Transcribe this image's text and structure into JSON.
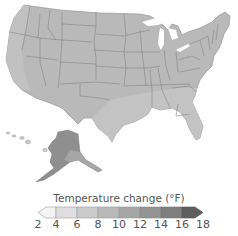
{
  "map": {
    "subject": "United States projected temperature change",
    "regions": [
      "contiguous-us",
      "alaska",
      "hawaii"
    ],
    "colors": {
      "water": "#ffffff",
      "border": "#7a7a7a",
      "west": "#b9b9b9",
      "plains": "#b0b0b0",
      "southeast": "#c4c4c4",
      "northeast": "#adadad",
      "alaska_north": "#8f8f8f",
      "alaska_south": "#a6a6a6",
      "hawaii": "#c8c8c8"
    }
  },
  "legend": {
    "title": "Temperature change (°F)",
    "ticks": [
      "2",
      "4",
      "6",
      "8",
      "10",
      "12",
      "14",
      "16",
      "18"
    ],
    "bins": [
      {
        "from": 2,
        "to": 4,
        "color": "#f4f4f4"
      },
      {
        "from": 4,
        "to": 6,
        "color": "#dedede"
      },
      {
        "from": 6,
        "to": 8,
        "color": "#cbcbcb"
      },
      {
        "from": 8,
        "to": 10,
        "color": "#b9b9b9"
      },
      {
        "from": 10,
        "to": 12,
        "color": "#a6a6a6"
      },
      {
        "from": 12,
        "to": 14,
        "color": "#939393"
      },
      {
        "from": 14,
        "to": 16,
        "color": "#7e7e7e"
      },
      {
        "from": 16,
        "to": 18,
        "color": "#5e5e5e"
      }
    ]
  }
}
